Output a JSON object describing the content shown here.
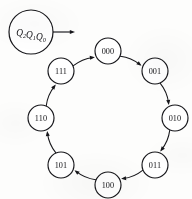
{
  "diagram": {
    "type": "state-transition-diagram",
    "title": "",
    "legend": {
      "label_plain": "Q2Q1Q0",
      "parts": [
        {
          "base": "Q",
          "sub": "2"
        },
        {
          "base": "Q",
          "sub": "1"
        },
        {
          "base": "Q",
          "sub": "0"
        }
      ],
      "pointer_icon": "right-arrow-icon",
      "center": {
        "x": 31,
        "y": 32
      },
      "radius": 22,
      "arrow_from_x": 53,
      "arrow_to_x": 75,
      "arrow_y": 32
    },
    "ring": {
      "center": {
        "x": 108,
        "y": 118
      },
      "radius": 67,
      "node_radius": 13,
      "direction": "clockwise"
    },
    "colors": {
      "stroke": "#16161a",
      "node_fill": "#ffffff",
      "background": "#fdfdfc"
    },
    "nodes": [
      {
        "id": "s000",
        "label": "000",
        "angle_deg": -90,
        "x": 108,
        "y": 51
      },
      {
        "id": "s001",
        "label": "001",
        "angle_deg": -45,
        "x": 155,
        "y": 71
      },
      {
        "id": "s010",
        "label": "010",
        "angle_deg": 0,
        "x": 175,
        "y": 118
      },
      {
        "id": "s011",
        "label": "011",
        "angle_deg": 45,
        "x": 155,
        "y": 165
      },
      {
        "id": "s100",
        "label": "100",
        "angle_deg": 90,
        "x": 108,
        "y": 185
      },
      {
        "id": "s101",
        "label": "101",
        "angle_deg": 135,
        "x": 61,
        "y": 165
      },
      {
        "id": "s110",
        "label": "110",
        "angle_deg": 180,
        "x": 41,
        "y": 118
      },
      {
        "id": "s111",
        "label": "111",
        "angle_deg": -135,
        "x": 61,
        "y": 71
      }
    ],
    "edges": [
      {
        "from": "s000",
        "to": "s001",
        "label": ""
      },
      {
        "from": "s001",
        "to": "s010",
        "label": ""
      },
      {
        "from": "s010",
        "to": "s011",
        "label": ""
      },
      {
        "from": "s011",
        "to": "s100",
        "label": ""
      },
      {
        "from": "s100",
        "to": "s101",
        "label": ""
      },
      {
        "from": "s101",
        "to": "s110",
        "label": ""
      },
      {
        "from": "s110",
        "to": "s111",
        "label": ""
      },
      {
        "from": "s111",
        "to": "s000",
        "label": ""
      }
    ]
  }
}
